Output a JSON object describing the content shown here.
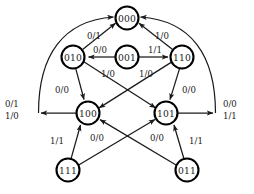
{
  "diagram": {
    "type": "state-transition-diagram",
    "title": "",
    "node_radius": 11.5,
    "stroke_color": "#1a1a1a",
    "node_fill": "#ffffff",
    "nodes": [
      {
        "id": "s000",
        "label": "000",
        "x": 127,
        "y": 18
      },
      {
        "id": "s010",
        "label": "010",
        "x": 73,
        "y": 57
      },
      {
        "id": "s001",
        "label": "001",
        "x": 127,
        "y": 57
      },
      {
        "id": "s110",
        "label": "110",
        "x": 182,
        "y": 57
      },
      {
        "id": "s100",
        "label": "100",
        "x": 88,
        "y": 113
      },
      {
        "id": "s101",
        "label": "101",
        "x": 166,
        "y": 113
      },
      {
        "id": "s111",
        "label": "111",
        "x": 68,
        "y": 170
      },
      {
        "id": "s011",
        "label": "011",
        "x": 187,
        "y": 170
      }
    ],
    "edges": [
      {
        "id": "e1",
        "from": "s010",
        "to": "s000",
        "label": "0/1",
        "lx": 94,
        "ly": 36
      },
      {
        "id": "e2",
        "from": "s110",
        "to": "s000",
        "label": "1/0",
        "lx": 162,
        "ly": 36
      },
      {
        "id": "e3",
        "from": "s001",
        "to": "s010",
        "label": "0/0",
        "lx": 100,
        "ly": 50
      },
      {
        "id": "e4",
        "from": "s001",
        "to": "s110",
        "label": "1/1",
        "lx": 155,
        "ly": 50
      },
      {
        "id": "e5",
        "from": "s010",
        "to": "s100",
        "label": "0/0",
        "lx": 62,
        "ly": 90
      },
      {
        "id": "e6",
        "from": "s010",
        "to": "s101",
        "label": "1/0",
        "lx": 108,
        "ly": 74
      },
      {
        "id": "e7",
        "from": "s110",
        "to": "s100",
        "label": "1/0",
        "lx": 146,
        "ly": 74
      },
      {
        "id": "e8",
        "from": "s110",
        "to": "s101",
        "label": "0/0",
        "lx": 189,
        "ly": 90
      },
      {
        "id": "e9",
        "from": "s111",
        "to": "s100",
        "label": "1/1",
        "lx": 57,
        "ly": 141
      },
      {
        "id": "e10",
        "from": "s111",
        "to": "s101",
        "label": "0/0",
        "lx": 97,
        "ly": 138
      },
      {
        "id": "e11",
        "from": "s011",
        "to": "s101",
        "label": "1/1",
        "lx": 196,
        "ly": 141
      },
      {
        "id": "e12",
        "from": "s011",
        "to": "s100",
        "label": "0/0",
        "lx": 157,
        "ly": 138
      },
      {
        "id": "e13",
        "from": "s100",
        "to": "s000",
        "label_top": "0/1",
        "label_bottom": "1/0",
        "lx": 15,
        "ly_top": 104,
        "ly_bottom": 117
      },
      {
        "id": "e14",
        "from": "s101",
        "to": "s000",
        "label_top": "0/0",
        "label_bottom": "1/1",
        "lx": 230,
        "ly_top": 104,
        "ly_bottom": 117
      }
    ]
  }
}
